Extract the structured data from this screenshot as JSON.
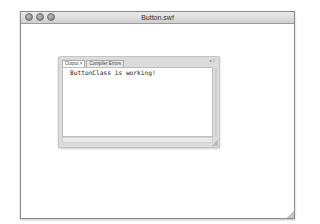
{
  "window": {
    "title": "Button.swf",
    "controls": [
      "close",
      "minimize",
      "zoom"
    ]
  },
  "panel": {
    "tabs": [
      {
        "label": "Output ×",
        "active": true
      },
      {
        "label": "Compiler Errors",
        "active": false
      }
    ],
    "controls_glyph": "▸≡",
    "output_text": "ButtonClass is working!"
  }
}
